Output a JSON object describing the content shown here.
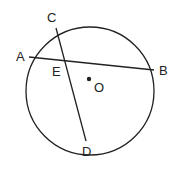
{
  "diagram": {
    "type": "circle-geometry",
    "circle": {
      "center_label": "O",
      "cx": 90,
      "cy": 91,
      "r": 64
    },
    "points": [
      {
        "id": "A",
        "label": "A",
        "x": 29,
        "y": 57,
        "lx": 16,
        "ly": 61
      },
      {
        "id": "B",
        "label": "B",
        "x": 154,
        "y": 70,
        "lx": 159,
        "ly": 75
      },
      {
        "id": "C",
        "label": "C",
        "x": 56,
        "y": 28,
        "lx": 47,
        "ly": 22
      },
      {
        "id": "D",
        "label": "D",
        "x": 86,
        "y": 141,
        "lx": 82,
        "ly": 156
      },
      {
        "id": "E",
        "label": "E",
        "x": 64,
        "y": 60,
        "lx": 52,
        "ly": 76
      },
      {
        "id": "O",
        "label": "O",
        "x": 89,
        "y": 79,
        "lx": 94,
        "ly": 92
      }
    ],
    "chords": [
      {
        "name": "AB",
        "from": "A",
        "to": "B"
      },
      {
        "name": "CD",
        "from": "C",
        "to": "D"
      }
    ],
    "intersection": {
      "point": "E",
      "of": [
        "AB",
        "CD"
      ]
    },
    "colors": {
      "stroke": "#222222",
      "background": "#ffffff"
    }
  }
}
